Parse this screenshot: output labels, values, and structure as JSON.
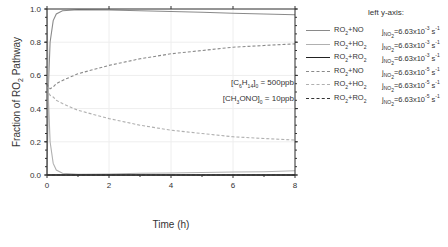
{
  "chart_data": {
    "type": "line",
    "title": "",
    "xlabel": "Time (h)",
    "ylabel": "Fraction of RO2 Pathway",
    "xlim": [
      0,
      8
    ],
    "ylim": [
      0,
      1.0
    ],
    "x_ticks": [
      "0",
      "2",
      "4",
      "6",
      "8"
    ],
    "y_ticks": [
      "0.0",
      "0.2",
      "0.4",
      "0.6",
      "0.8",
      "1.0"
    ],
    "grid": true,
    "legend_position": "right-outside",
    "legend_title": "left y-axis:",
    "annotations": [
      "[C6H14]0 = 500ppb",
      "[CH3ONO]0 = 10ppb"
    ],
    "x": [
      0,
      0.05,
      0.1,
      0.2,
      0.3,
      0.5,
      1,
      2,
      3,
      4,
      5,
      6,
      7,
      8
    ],
    "series": [
      {
        "name": "RO2+NO",
        "rate": "jNO2=6.63x10^-3 s^-1",
        "style": "solid",
        "color": "#8a8a8a",
        "values": [
          0.0,
          0.55,
          0.8,
          0.93,
          0.97,
          0.99,
          0.995,
          0.994,
          0.99,
          0.985,
          0.98,
          0.975,
          0.97,
          0.965
        ]
      },
      {
        "name": "RO2+HO2",
        "rate": "jNO2=6.63x10^-3 s^-1",
        "style": "solid",
        "color": "#b0b0b0",
        "values": [
          1.0,
          0.45,
          0.2,
          0.07,
          0.03,
          0.01,
          0.005,
          0.006,
          0.01,
          0.012,
          0.015,
          0.018,
          0.02,
          0.025
        ]
      },
      {
        "name": "RO2+RO2",
        "rate": "jNO2=6.63x10^-3 s^-1",
        "style": "solid",
        "color": "#222222",
        "values": [
          0,
          0,
          0,
          0,
          0,
          0,
          0,
          0,
          0,
          0,
          0,
          0,
          0,
          0
        ]
      },
      {
        "name": "RO2+NO",
        "rate": "jNO2=6.63x10^-5 s^-1",
        "style": "dashed",
        "color": "#8a8a8a",
        "values": [
          0.55,
          0.53,
          0.52,
          0.53,
          0.55,
          0.57,
          0.61,
          0.66,
          0.7,
          0.73,
          0.75,
          0.77,
          0.78,
          0.79
        ]
      },
      {
        "name": "RO2+HO2",
        "rate": "jNO2=6.63x10^-5 s^-1",
        "style": "dashed",
        "color": "#b0b0b0",
        "values": [
          0.55,
          0.5,
          0.48,
          0.47,
          0.45,
          0.43,
          0.39,
          0.34,
          0.3,
          0.27,
          0.25,
          0.23,
          0.22,
          0.21
        ]
      },
      {
        "name": "RO2+RO2",
        "rate": "jNO2=6.63x10^-5 s^-1",
        "style": "dashed",
        "color": "#333333",
        "values": [
          0,
          0,
          0,
          0,
          0,
          0,
          0,
          0,
          0,
          0,
          0,
          0,
          0,
          0
        ]
      }
    ]
  },
  "legend": {
    "title": "left y-axis:",
    "items": [
      {
        "label": "RO2+NO",
        "rate": "jNO2=6.63x10-3 s-1"
      },
      {
        "label": "RO2+HO2",
        "rate": "jNO2=6.63x10-3 s-1"
      },
      {
        "label": "RO2+RO2",
        "rate": "jNO2=6.63x10-3 s-1"
      },
      {
        "label": "RO2+NO",
        "rate": "jNO2=6.63x10-5 s-1"
      },
      {
        "label": "RO2+HO2",
        "rate": "jNO2=6.63x10-5 s-1"
      },
      {
        "label": "RO2+RO2",
        "rate": "jNO2=6.63x10-5 s-1"
      }
    ]
  },
  "annotation": {
    "line1": "[C6H14]0 = 500ppb",
    "line2": "[CH3ONO]0 = 10ppb"
  }
}
